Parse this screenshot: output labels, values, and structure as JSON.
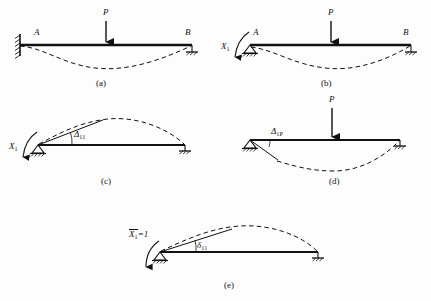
{
  "document": {
    "kind": "engineering-diagram",
    "topic": "force-method-statically-indeterminate-beam",
    "background_color": "#fdfdfd",
    "ink_color": "#111111"
  },
  "figures": [
    {
      "id": "a",
      "caption": "(a)",
      "description": "propped cantilever with concentrated load P, fixed support at A, roller at B, sagging dashed deflection curve",
      "labels": {
        "left_node": "A",
        "right_node": "B",
        "load": "P"
      },
      "supports": {
        "left": "fixed-wall",
        "right": "roller"
      },
      "deflection": "sag"
    },
    {
      "id": "b",
      "caption": "(b)",
      "description": "primary system: pin at A with redundant moment X1 applied, load P, roller at B, sagging dashed deflection",
      "labels": {
        "left_node": "A",
        "right_node": "B",
        "load": "P",
        "redundant": "X",
        "redundant_sub": "1"
      },
      "supports": {
        "left": "pin",
        "right": "roller"
      },
      "deflection": "sag"
    },
    {
      "id": "c",
      "caption": "(c)",
      "description": "primary system loaded only by redundant X1, rotation Delta-11 at A, hogging dashed deflection",
      "labels": {
        "redundant": "X",
        "redundant_sub": "1",
        "displacement": "Δ",
        "displacement_sub": "11"
      },
      "supports": {
        "left": "pin",
        "right": "roller"
      },
      "deflection": "hog"
    },
    {
      "id": "d",
      "caption": "(d)",
      "description": "primary system loaded only by external load P, rotation Delta-1P at A, sagging dashed deflection",
      "labels": {
        "load": "P",
        "displacement": "Δ",
        "displacement_sub": "1P"
      },
      "supports": {
        "left": "pin",
        "right": "roller"
      },
      "deflection": "sag"
    },
    {
      "id": "e",
      "caption": "(e)",
      "description": "unit state: unit redundant moment X1-bar equals 1, flexibility coefficient delta-11, hogging dashed deflection",
      "labels": {
        "unit_redundant": "X",
        "unit_redundant_sub": "1",
        "unit_redundant_eq": "=1",
        "flexibility": "δ",
        "flexibility_sub": "11"
      },
      "supports": {
        "left": "pin",
        "right": "roller"
      },
      "deflection": "hog"
    }
  ]
}
